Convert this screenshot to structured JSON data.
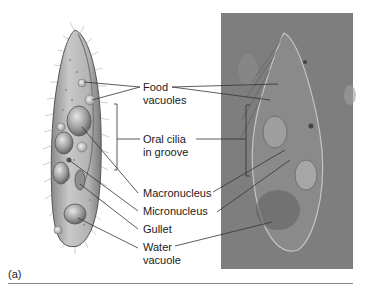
{
  "figure": {
    "panel_label": "(a)",
    "diagram": {
      "type": "illustration",
      "description": "drawing of ciliate cell"
    },
    "photo": {
      "type": "micrograph",
      "description": "light micrograph of ciliate cell"
    }
  },
  "labels": [
    {
      "id": "food-vacuoles",
      "lines": [
        "Food",
        "vacuoles"
      ]
    },
    {
      "id": "oral-cilia",
      "lines": [
        "Oral cilia",
        "in groove"
      ]
    },
    {
      "id": "macronucleus",
      "lines": [
        "Macronucleus"
      ]
    },
    {
      "id": "micronucleus",
      "lines": [
        "Micronucleus"
      ]
    },
    {
      "id": "gullet",
      "lines": [
        "Gullet"
      ]
    },
    {
      "id": "water-vacuole",
      "lines": [
        "Water",
        "vacuole"
      ]
    }
  ],
  "colors": {
    "leader_line": "#333333",
    "cell_body": "#b5b5b5",
    "photo_background": "#7d7d7d"
  }
}
